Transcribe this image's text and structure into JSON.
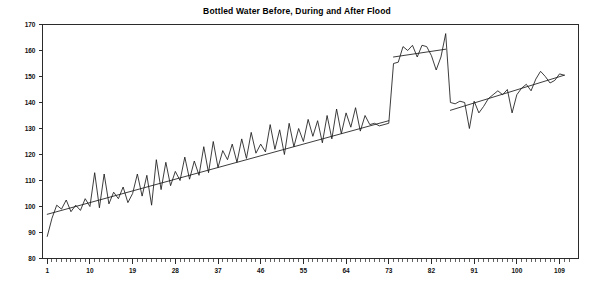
{
  "chart_data": {
    "type": "line",
    "title": "Bottled Water Before, During and After Flood",
    "xlabel": "",
    "ylabel": "",
    "xlim": [
      0,
      113
    ],
    "ylim": [
      80,
      170
    ],
    "ytick_labels": [
      "80",
      "90",
      "100",
      "110",
      "120",
      "130",
      "140",
      "150",
      "160",
      "170"
    ],
    "ytick_values": [
      80,
      90,
      100,
      110,
      120,
      130,
      140,
      150,
      160,
      170
    ],
    "xtick_labels": [
      "1",
      "10",
      "19",
      "28",
      "37",
      "46",
      "55",
      "64",
      "73",
      "82",
      "91",
      "100",
      "109"
    ],
    "xtick_values": [
      1,
      10,
      19,
      28,
      37,
      46,
      55,
      64,
      73,
      82,
      91,
      100,
      109
    ],
    "xtick_minor_step": 1,
    "grid": false,
    "legend": "none",
    "line_color": "#1a1a1a",
    "axis_color": "#2b2b2b",
    "background_color": "#ffffff",
    "series": [
      {
        "name": "Bottled Water Sales",
        "x": [
          1,
          2,
          3,
          4,
          5,
          6,
          7,
          8,
          9,
          10,
          11,
          12,
          13,
          14,
          15,
          16,
          17,
          18,
          19,
          20,
          21,
          22,
          23,
          24,
          25,
          26,
          27,
          28,
          29,
          30,
          31,
          32,
          33,
          34,
          35,
          36,
          37,
          38,
          39,
          40,
          41,
          42,
          43,
          44,
          45,
          46,
          47,
          48,
          49,
          50,
          51,
          52,
          53,
          54,
          55,
          56,
          57,
          58,
          59,
          60,
          61,
          62,
          63,
          64,
          65,
          66,
          67,
          68,
          69,
          70,
          71,
          72,
          73,
          74,
          75,
          76,
          77,
          78,
          79,
          80,
          81,
          82,
          83,
          84,
          85,
          86,
          87,
          88,
          89,
          90,
          91,
          92,
          93,
          94,
          95,
          96,
          97,
          98,
          99,
          100,
          101,
          102,
          103,
          104,
          105,
          106,
          107,
          108,
          109,
          110
        ],
        "values": [
          88.5,
          95.5,
          100.5,
          99.0,
          102.5,
          98.0,
          100.5,
          98.5,
          103.0,
          100.0,
          113.0,
          99.5,
          112.5,
          101.0,
          105.5,
          103.0,
          107.5,
          101.5,
          105.0,
          112.5,
          104.0,
          112.0,
          100.5,
          118.0,
          106.5,
          117.0,
          108.0,
          113.5,
          110.0,
          119.0,
          110.5,
          117.5,
          112.0,
          123.0,
          113.0,
          125.0,
          115.0,
          121.5,
          118.0,
          124.0,
          117.0,
          126.0,
          118.5,
          128.5,
          120.5,
          124.0,
          121.0,
          131.5,
          122.0,
          129.5,
          120.0,
          132.0,
          123.0,
          130.0,
          125.0,
          133.5,
          127.0,
          133.0,
          124.5,
          135.0,
          126.0,
          137.5,
          128.0,
          136.0,
          130.5,
          138.0,
          129.0,
          135.0,
          131.5,
          132.0,
          131.0,
          131.5,
          132.0,
          155.0,
          155.5,
          161.5,
          160.0,
          162.0,
          157.5,
          162.0,
          161.5,
          158.0,
          152.5,
          157.5,
          166.5,
          140.0,
          139.5,
          140.5,
          140.0,
          130.0,
          140.5,
          136.0,
          138.5,
          141.5,
          143.0,
          144.5,
          143.0,
          145.0,
          136.0,
          143.0,
          145.5,
          147.0,
          144.5,
          149.0,
          152.0,
          150.0,
          147.5,
          148.5,
          151.0,
          150.5
        ]
      }
    ],
    "trend_segments": [
      {
        "name": "pre-flood-trend",
        "x_start": 1,
        "y_start": 97.0,
        "x_end": 73,
        "y_end": 133.0
      },
      {
        "name": "flood-trend",
        "x_start": 74,
        "y_start": 157.5,
        "x_end": 85,
        "y_end": 160.5
      },
      {
        "name": "post-flood-trend",
        "x_start": 86,
        "y_start": 137.0,
        "x_end": 110,
        "y_end": 150.5
      }
    ],
    "annotations": []
  }
}
